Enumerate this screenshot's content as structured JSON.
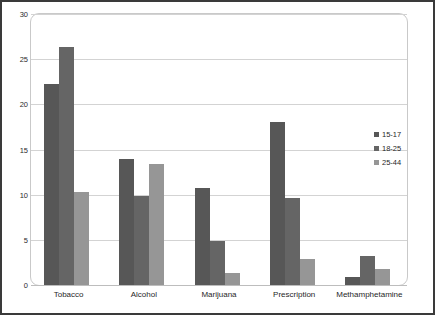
{
  "chart_data": {
    "type": "bar",
    "title": "",
    "subtitle": "",
    "xlabel": "",
    "ylabel": "",
    "ylim": [
      0,
      30
    ],
    "yticks": [
      0,
      5,
      10,
      15,
      20,
      25,
      30
    ],
    "ytick_labels": [
      "0",
      "5",
      "10",
      "15",
      "20",
      "25",
      "30"
    ],
    "grid": true,
    "legend_position": "right",
    "categories": [
      "Tobacco",
      "Alcohol",
      "Marijuana",
      "Prescription",
      "Methamphetamine"
    ],
    "series": [
      {
        "name": "15-17",
        "color": "#575757",
        "values": [
          22.2,
          13.9,
          10.7,
          18.1,
          0.9
        ]
      },
      {
        "name": "18-25",
        "color": "#656565",
        "values": [
          26.3,
          9.8,
          4.9,
          9.6,
          3.2
        ]
      },
      {
        "name": "25-44",
        "color": "#969696",
        "values": [
          10.3,
          13.4,
          1.3,
          2.9,
          1.8
        ]
      }
    ]
  },
  "colors": {
    "border": "#3a3a3a",
    "plot_frame": "#c9c9c9",
    "gridline": "#d3d3d3",
    "background": "#ffffff",
    "text": "#1f1f1f"
  }
}
